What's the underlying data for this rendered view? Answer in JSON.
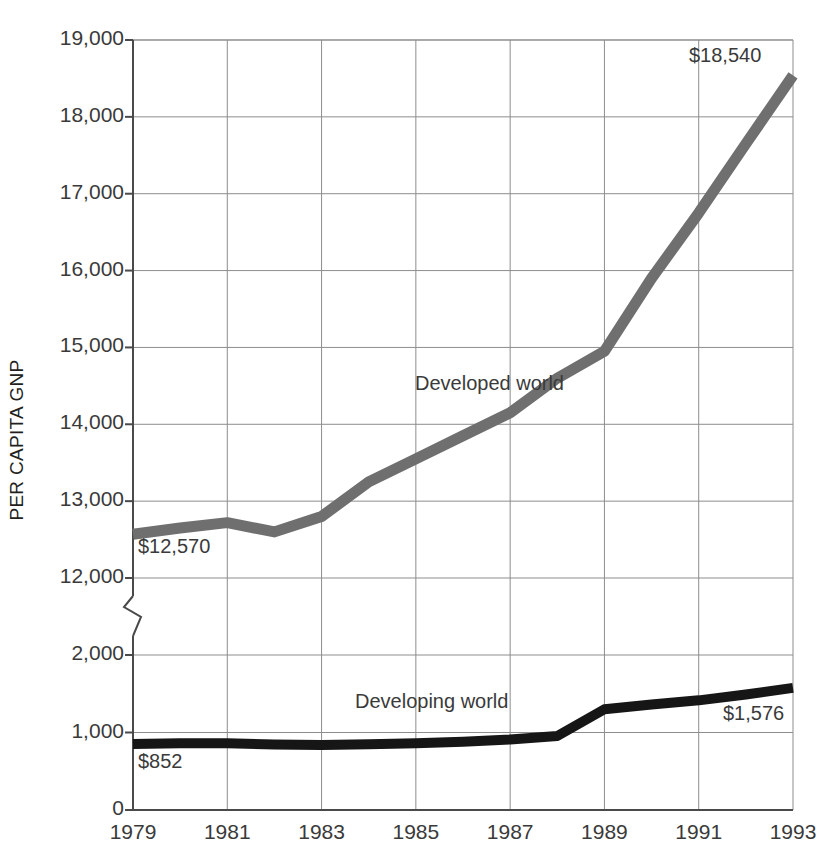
{
  "chart_data": {
    "type": "line",
    "title": "",
    "xlabel": "",
    "ylabel": "PER CAPITA GNP",
    "grid": true,
    "legend_position": "inline-annotation",
    "axis_break": {
      "between": [
        2000,
        12000
      ],
      "style": "zigzag"
    },
    "x": [
      1979,
      1980,
      1981,
      1982,
      1983,
      1984,
      1985,
      1986,
      1987,
      1988,
      1989,
      1990,
      1991,
      1992,
      1993
    ],
    "x_tick_labels": [
      "1979",
      "1981",
      "1983",
      "1985",
      "1987",
      "1989",
      "1991",
      "1993"
    ],
    "x_tick_values": [
      1979,
      1981,
      1983,
      1985,
      1987,
      1989,
      1991,
      1993
    ],
    "y_tick_labels": [
      "0",
      "1,000",
      "2,000",
      "12,000",
      "13,000",
      "14,000",
      "15,000",
      "16,000",
      "17,000",
      "18,000",
      "19,000"
    ],
    "y_tick_values": [
      0,
      1000,
      2000,
      12000,
      13000,
      14000,
      15000,
      16000,
      17000,
      18000,
      19000
    ],
    "ylim_lower": [
      0,
      2000
    ],
    "ylim_upper": [
      12000,
      19000
    ],
    "series": [
      {
        "name": "Developed world",
        "color": "#6f6f6f",
        "values": [
          12570,
          12650,
          12720,
          12600,
          12800,
          13250,
          13550,
          13850,
          14150,
          14600,
          14950,
          15900,
          16750,
          17650,
          18540
        ],
        "start_label": "$12,570",
        "end_label": "$18,540"
      },
      {
        "name": "Developing world",
        "color": "#161616",
        "values": [
          852,
          860,
          862,
          845,
          840,
          850,
          860,
          880,
          910,
          955,
          1300,
          1360,
          1415,
          1490,
          1576
        ],
        "start_label": "$852",
        "end_label": "$1,576"
      }
    ],
    "annotations": [
      {
        "text": "Developed world",
        "ref": "series-developed"
      },
      {
        "text": "Developing world",
        "ref": "series-developing"
      },
      {
        "text": "$18,540",
        "ref": "developed-end-value"
      },
      {
        "text": "$12,570",
        "ref": "developed-start-value"
      },
      {
        "text": "$1,576",
        "ref": "developing-end-value"
      },
      {
        "text": "$852",
        "ref": "developing-start-value"
      }
    ]
  },
  "axis": {
    "y_title": "PER CAPITA GNP",
    "y_ticks": [
      "19,000",
      "18,000",
      "17,000",
      "16,000",
      "15,000",
      "14,000",
      "13,000",
      "12,000",
      "2,000",
      "1,000",
      "0"
    ],
    "x_ticks": [
      "1979",
      "1981",
      "1983",
      "1985",
      "1987",
      "1989",
      "1991",
      "1993"
    ]
  },
  "labels": {
    "developed_series": "Developed world",
    "developing_series": "Developing world",
    "developed_end": "$18,540",
    "developed_start": "$12,570",
    "developing_end": "$1,576",
    "developing_start": "$852"
  }
}
